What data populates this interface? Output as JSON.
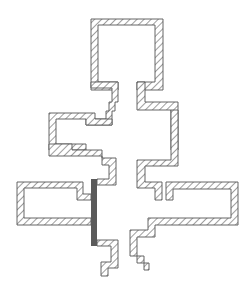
{
  "diagram": {
    "type": "hatched-cross-section",
    "width": 251,
    "height": 287,
    "colors": {
      "background": "#ffffff",
      "outline": "#555555",
      "hatch": "#666666",
      "bar": "#5a5a5a"
    },
    "walls": [
      {
        "name": "top-chamber-wall",
        "points": "91,19 163,19 163,90 137,90 137,82 155,82 155,25 98,25 98,82 118,82 118,90 91,90"
      },
      {
        "name": "left-neck-wall",
        "points": "91,82 118,82 118,102 115,102 115,111 112,111 112,125 86,125 86,119 106,119 106,111 109,111 109,102 112,102 112,88 91,88"
      },
      {
        "name": "right-neck-wall",
        "points": "137,82 145,82 145,102 178,102 178,150 171,150 171,110 137,110"
      },
      {
        "name": "left-upper-chamber-wall",
        "points": "49,113 95,113 95,119 112,119 112,125 86,125 86,119 56,119 56,144 86,144 86,150 49,150"
      },
      {
        "name": "left-upper-chamber-lower",
        "points": "49,144 72,144 72,150 102,150 102,158 109,158 109,158 116,158 116,185 97,185 97,179 109,179 109,165 102,165 102,156 49,156"
      },
      {
        "name": "right-mid-wall",
        "points": "171,110 178,110 178,166 145,166 145,182 162,182 162,200 155,200 155,188 137,188 137,160 171,160"
      },
      {
        "name": "right-lower-chamber-wall",
        "points": "166,182 238,182 238,225 155,225 155,237 137,237 137,263 149,263 149,270 144,270 144,256 130,256 130,230 148,230 148,218 231,218 231,189 173,189 173,200 166,200"
      },
      {
        "name": "left-lower-chamber-wall",
        "points": "17,182 83,182 83,194 91,194 91,200 77,200 77,188 24,188 24,218 91,218 91,225 17,225"
      },
      {
        "name": "bottom-left-foot-wall",
        "points": "97,240 118,240 118,268 108,268 108,276 101,276 101,262 111,262 111,246 97,246"
      }
    ],
    "bars": [
      {
        "name": "dark-seal-bar",
        "x": 91,
        "y": 179,
        "width": 6,
        "height": 67
      }
    ]
  }
}
